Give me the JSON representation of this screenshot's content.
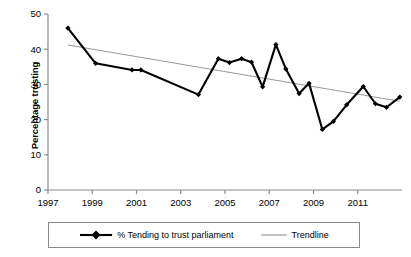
{
  "chart_data": {
    "type": "line",
    "title": "",
    "xlabel": "",
    "ylabel": "Percentage trusting",
    "xlim": [
      1997,
      2013
    ],
    "ylim": [
      0,
      50
    ],
    "ytick_labels": [
      "0",
      "10",
      "20",
      "30",
      "40",
      "50"
    ],
    "yticks": [
      0,
      10,
      20,
      30,
      40,
      50
    ],
    "xtick_labels": [
      "1997",
      "1999",
      "2001",
      "2003",
      "2005",
      "2007",
      "2009",
      "2011"
    ],
    "xticks": [
      1997,
      1999,
      2001,
      2003,
      2005,
      2007,
      2009,
      2011
    ],
    "grid": false,
    "legend_position": "bottom",
    "series": [
      {
        "name": "% Tending to trust parliament",
        "marker": "diamond",
        "color": "#000000",
        "x": [
          1997.9,
          1999.15,
          2000.8,
          2001.2,
          2003.8,
          2004.7,
          2005.2,
          2005.75,
          2006.2,
          2006.7,
          2007.3,
          2007.75,
          2008.35,
          2008.8,
          2009.4,
          2009.9,
          2010.5,
          2011.25,
          2011.8,
          2012.3,
          2012.9
        ],
        "values": [
          46.0,
          36.0,
          34.1,
          34.1,
          27.1,
          37.3,
          36.2,
          37.3,
          36.3,
          29.3,
          41.3,
          34.4,
          27.4,
          30.3,
          17.2,
          19.5,
          24.2,
          29.4,
          24.5,
          23.5,
          26.4
        ]
      },
      {
        "name": "Trendline",
        "marker": "none",
        "color": "#808080",
        "x": [
          1997.9,
          2012.9
        ],
        "values": [
          41.2,
          25.2
        ]
      }
    ]
  },
  "legend": {
    "entries": [
      {
        "label": "% Tending to trust parliament",
        "type": "line-marker",
        "color": "#000000"
      },
      {
        "label": "Trendline",
        "type": "line",
        "color": "#9a9a9a"
      }
    ]
  },
  "axis": {
    "y_title": "Percentage trusting"
  },
  "colors": {
    "series": "#000000",
    "trendline": "#9a9a9a",
    "axis": "#808080",
    "legend_border": "#8a8a8a"
  }
}
